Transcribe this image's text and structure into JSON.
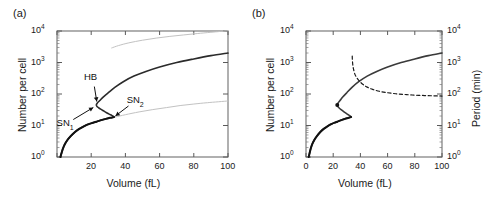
{
  "figure": {
    "panel_a_label": "(a)",
    "panel_b_label": "(b)"
  },
  "chart_data": [
    {
      "type": "line",
      "panel": "(a)",
      "title": "",
      "xlabel": "Volume (fL)",
      "ylabel": "Number per cell",
      "xlim": [
        0,
        100
      ],
      "ylim": [
        1,
        10000
      ],
      "yscale": "log",
      "xscale": "linear",
      "grid": false,
      "legend_position": "none",
      "xticks": [
        0,
        20,
        40,
        60,
        80,
        100
      ],
      "xticklabels": [
        "",
        "20",
        "40",
        "60",
        "80",
        "100"
      ],
      "yticks": [
        1,
        10,
        100,
        1000,
        10000
      ],
      "yticklabels": [
        "10⁰",
        "10¹",
        "10²",
        "10³",
        "10⁴"
      ],
      "annotations": [
        {
          "text": "HB",
          "x": 21,
          "y": 330,
          "point_x": 23.5,
          "point_y": 48
        },
        {
          "text": "SN₁",
          "x": 5,
          "y": 11,
          "point_x": 22.5,
          "point_y": 41
        },
        {
          "text": "SN₂",
          "x": 46,
          "y": 62,
          "point_x": 33,
          "point_y": 18
        }
      ],
      "series": [
        {
          "name": "steady-state branch (black, S-shaped with hysteresis)",
          "style": "solid",
          "color": "#2b2b2b",
          "x": [
            2.0,
            2.6,
            3.4,
            4.5,
            6.0,
            8.0,
            10.5,
            13.0,
            16.0,
            19.0,
            21.5,
            23.0,
            24.0,
            25.5,
            27.0,
            28.5,
            30.0,
            31.5,
            32.8,
            33.4,
            33.0,
            32.0,
            30.5,
            29.0,
            27.5,
            26.0,
            24.5,
            23.4,
            23.0,
            23.6,
            25.0,
            27.0,
            30.0,
            34.0,
            39.0,
            45.0,
            52.0,
            60.0,
            70.0,
            80.0,
            90.0,
            100.0
          ],
          "y": [
            1.0,
            1.3,
            1.8,
            2.5,
            3.4,
            4.6,
            6.2,
            7.8,
            9.6,
            11.3,
            12.5,
            13.2,
            13.8,
            14.6,
            15.4,
            16.2,
            17.0,
            17.7,
            18.3,
            18.6,
            19.5,
            21.0,
            23.0,
            25.5,
            28.5,
            32.0,
            36.0,
            40.0,
            45.0,
            52.0,
            62.0,
            80.0,
            110.0,
            165.0,
            250.0,
            370.0,
            520.0,
            720.0,
            1000.0,
            1300.0,
            1650.0,
            2000.0
          ]
        },
        {
          "name": "upper gray reference curve",
          "style": "solid",
          "color": "#c2c2c2",
          "x": [
            32,
            36,
            42,
            50,
            58,
            66,
            74,
            82,
            90,
            100
          ],
          "y": [
            2900,
            3450,
            4200,
            5100,
            5950,
            6750,
            7500,
            8300,
            9100,
            10200
          ]
        },
        {
          "name": "lower gray reference curve",
          "style": "solid",
          "color": "#c2c2c2",
          "x": [
            30,
            34,
            40,
            48,
            56,
            64,
            72,
            80,
            88,
            100
          ],
          "y": [
            16.5,
            18.5,
            22.0,
            27.0,
            32.0,
            37.0,
            43.0,
            48.0,
            53.0,
            60.0
          ]
        }
      ]
    },
    {
      "type": "line",
      "panel": "(b)",
      "title": "",
      "xlabel": "Volume (fL)",
      "ylabel": "Number per cell",
      "ylabel_right": "Period (min)",
      "xlim": [
        0,
        100
      ],
      "ylim": [
        1,
        10000
      ],
      "ylim_right": [
        1,
        10000
      ],
      "yscale": "log",
      "xscale": "linear",
      "grid": false,
      "legend_position": "none",
      "xticks": [
        0,
        20,
        40,
        60,
        80,
        100
      ],
      "xticklabels": [
        "0",
        "20",
        "40",
        "60",
        "80",
        "100"
      ],
      "yticks": [
        1,
        10,
        100,
        1000,
        10000
      ],
      "yticklabels": [
        "10⁰",
        "10¹",
        "10²",
        "10³",
        "10⁴"
      ],
      "yticks_right": [
        1,
        10,
        100,
        1000,
        10000
      ],
      "yticklabels_right": [
        "10⁰",
        "10¹",
        "10²",
        "10³",
        "10⁴"
      ],
      "annotations": [],
      "series": [
        {
          "name": "steady-state branch (black/gray S-shaped)",
          "style": "solid",
          "color": "#3a3a3a",
          "x": [
            2.0,
            2.6,
            3.4,
            4.5,
            6.0,
            8.0,
            10.5,
            13.0,
            16.0,
            19.0,
            21.5,
            23.0,
            24.0,
            25.5,
            27.0,
            28.5,
            30.0,
            31.5,
            32.6,
            33.2,
            32.8,
            31.8,
            30.3,
            28.8,
            27.3,
            25.8,
            24.4,
            23.4,
            23.0,
            23.6,
            25.0,
            27.0,
            30.0,
            34.0,
            39.0,
            45.0,
            52.0,
            60.0,
            70.0,
            80.0,
            90.0,
            100.0
          ],
          "y": [
            1.0,
            1.3,
            1.8,
            2.5,
            3.4,
            4.6,
            6.2,
            7.8,
            9.6,
            11.3,
            12.5,
            13.2,
            13.8,
            14.6,
            15.4,
            16.2,
            17.0,
            17.7,
            18.3,
            18.6,
            19.5,
            21.0,
            23.0,
            25.5,
            28.5,
            32.0,
            36.0,
            40.0,
            45.0,
            52.0,
            62.0,
            80.0,
            110.0,
            165.0,
            250.0,
            370.0,
            520.0,
            720.0,
            1000.0,
            1300.0,
            1650.0,
            2000.0
          ]
        },
        {
          "name": "oscillation period (dashed)",
          "style": "dashed",
          "color": "#1a1a1a",
          "axis": "right",
          "x": [
            34.0,
            34.1,
            34.4,
            35.0,
            36.0,
            37.5,
            39.5,
            42.0,
            45.0,
            49.0,
            54.0,
            60.0,
            66.0,
            72.0,
            78.0,
            85.0,
            92.0,
            100.0
          ],
          "y": [
            1600,
            1200,
            850,
            600,
            420,
            320,
            250,
            200,
            165,
            140,
            122,
            110,
            102,
            97,
            93,
            90,
            88,
            86
          ]
        }
      ],
      "markers": [
        {
          "name": "hopf-bifurcation-point",
          "x": 23.0,
          "y": 45,
          "color": "#111111"
        }
      ]
    }
  ]
}
